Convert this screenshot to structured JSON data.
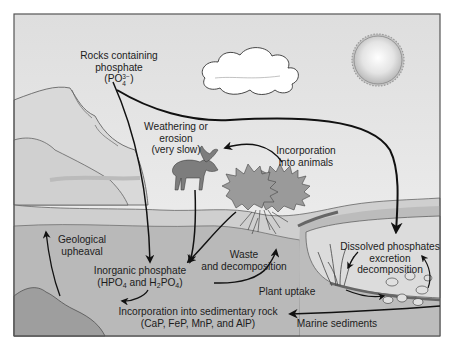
{
  "diagram": {
    "colors": {
      "sky": "#ececec",
      "rock": "#d6d6d6",
      "ground_upper": "#c9c9c9",
      "ground_lower": "#b4b4b4",
      "water": "#d9d9d9",
      "arrow": "#111111",
      "frame": "#555555"
    },
    "labels": {
      "rocks_phosphate": {
        "line1": "Rocks containing",
        "line2": "phosphate",
        "formula_open": "(PO",
        "formula_sup": "3−",
        "formula_sub": "4",
        "formula_close": ")"
      },
      "weathering": {
        "line1": "Weathering or",
        "line2": "erosion",
        "line3": "(very slow)"
      },
      "incorporation_animals": {
        "line1": "Incorporation",
        "line2": "into animals"
      },
      "geological_upheaval": {
        "line1": "Geological",
        "line2": "upheaval"
      },
      "inorganic_phosphate": {
        "line1": "Inorganic phosphate",
        "l2_a": "(HPO",
        "l2_sub1": "4",
        "l2_b": " and H",
        "l2_sub2": "2",
        "l2_c": "PO",
        "l2_sub3": "4",
        "l2_d": ")"
      },
      "waste_decomposition": {
        "line1": "Waste",
        "line2": "and decomposition"
      },
      "plant_uptake": "Plant uptake",
      "dissolved_phosphates": {
        "line1": "Dissolved phosphates",
        "line2": "excretion",
        "line3": "decomposition"
      },
      "sedimentary_rock": {
        "line1": "Incorporation into sedimentary rock",
        "line2": "(CaP, FeP, MnP, and AlP)"
      },
      "marine_sediments": "Marine sediments"
    },
    "illustrations": [
      "cliff-rocks",
      "cloud",
      "sun",
      "moose",
      "plant-bush",
      "roots",
      "lake-water",
      "aquatic-plants",
      "fish",
      "bottom-rock"
    ]
  }
}
